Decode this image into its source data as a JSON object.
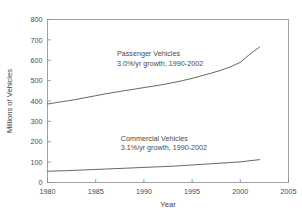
{
  "chart_data": {
    "type": "line",
    "title": "",
    "xlabel": "Year",
    "ylabel": "Millions of Vehicles",
    "xlim": [
      1980,
      2005
    ],
    "ylim": [
      0,
      800
    ],
    "xticks": [
      1980,
      1985,
      1990,
      1995,
      2000,
      2005
    ],
    "xtick_labels": [
      "1980",
      "1985",
      "1990",
      "1995",
      "2000",
      "2005"
    ],
    "yticks": [
      0,
      100,
      200,
      300,
      400,
      500,
      600,
      700,
      800
    ],
    "ytick_labels": [
      "0",
      "100",
      "200",
      "300",
      "400",
      "500",
      "600",
      "700",
      "800"
    ],
    "grid": false,
    "legend": "none",
    "line_color": "#555555",
    "frame_color": "#8a8a8a",
    "x": [
      1980,
      1981,
      1982,
      1983,
      1984,
      1985,
      1986,
      1987,
      1988,
      1989,
      1990,
      1991,
      1992,
      1993,
      1994,
      1995,
      1996,
      1997,
      1998,
      1999,
      2000,
      2001,
      2002
    ],
    "series": [
      {
        "name": "Passenger Vehicles",
        "values": [
          385,
          393,
          400,
          408,
          417,
          426,
          435,
          443,
          451,
          458,
          466,
          473,
          481,
          490,
          500,
          511,
          524,
          537,
          551,
          568,
          590,
          630,
          665
        ],
        "annotation_line1": "Passenger Vehicles",
        "annotation_line2": "3.0%/yr growth, 1990-2002"
      },
      {
        "name": "Commercial Vehicles",
        "values": [
          55,
          57,
          58,
          60,
          62,
          64,
          66,
          68,
          70,
          72,
          74,
          76,
          78,
          80,
          83,
          86,
          89,
          92,
          95,
          98,
          101,
          107,
          112
        ],
        "annotation_line1": "Commercial Vehicles",
        "annotation_line2": "3.1%/yr growth, 1990-2002"
      }
    ],
    "annotations": [
      {
        "text": "Passenger Vehicles",
        "x": 1987.2,
        "y": 620
      },
      {
        "text": "3.0%/yr growth, 1990-2002",
        "x": 1987.2,
        "y": 570
      },
      {
        "text": "Commercial Vehicles",
        "x": 1987.6,
        "y": 205
      },
      {
        "text": "3.1%/yr growth, 1990-2002",
        "x": 1987.6,
        "y": 158
      }
    ]
  }
}
